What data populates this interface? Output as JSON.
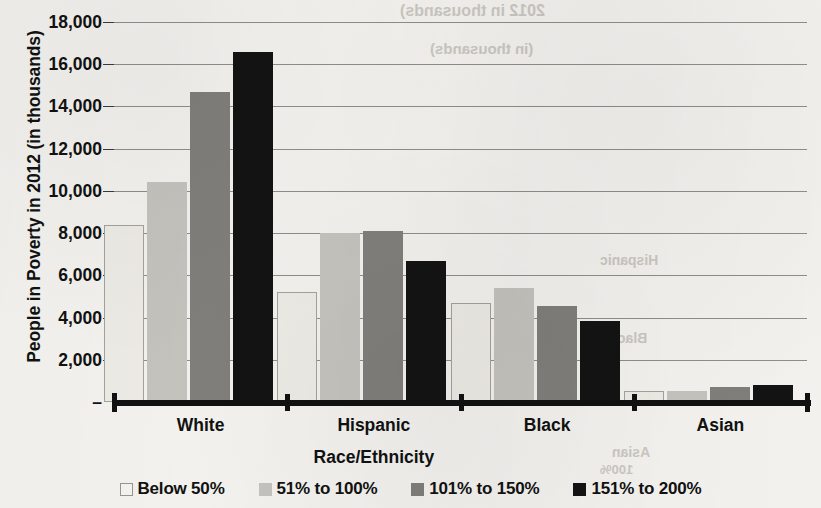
{
  "chart_data": {
    "type": "bar",
    "title": "",
    "xlabel": "Race/Ethnicity",
    "ylabel": "People in Poverty in 2012 (in thousands)",
    "categories": [
      "White",
      "Hispanic",
      "Black",
      "Asian"
    ],
    "series": [
      {
        "name": "Below 50%",
        "color": "#eceae4",
        "values": [
          8400,
          5200,
          4700,
          500
        ]
      },
      {
        "name": "51% to 100%",
        "color": "#c4c2bd",
        "values": [
          10400,
          8000,
          5400,
          500
        ]
      },
      {
        "name": "101% to 150%",
        "color": "#807e7a",
        "values": [
          14700,
          8100,
          4550,
          700
        ]
      },
      {
        "name": "151% to 200%",
        "color": "#131313",
        "values": [
          16600,
          6700,
          3850,
          800
        ]
      }
    ],
    "ylim": [
      0,
      18000
    ],
    "ytick_labels": [
      "18,000",
      "16,000",
      "14,000",
      "12,000",
      "10,000",
      "8,000",
      "6,000",
      "4,000",
      "2,000",
      "–"
    ],
    "ytick_values": [
      18000,
      16000,
      14000,
      12000,
      10000,
      8000,
      6000,
      4000,
      2000,
      0
    ],
    "grid": true,
    "legend_position": "bottom"
  },
  "legend": {
    "items": [
      {
        "label": "Below 50%",
        "swatch": "series-0-swatch"
      },
      {
        "label": "51% to 100%",
        "swatch": "series-1-swatch"
      },
      {
        "label": "101% to 150%",
        "swatch": "series-2-swatch"
      },
      {
        "label": "151% to 200%",
        "swatch": "series-3-swatch"
      }
    ]
  },
  "bleed_through": {
    "t1": "2012 in thousands)",
    "t2": "(in thousands)",
    "t3": "Hispanic",
    "t4": "Black",
    "t5": "Asian",
    "t6": "100%"
  }
}
